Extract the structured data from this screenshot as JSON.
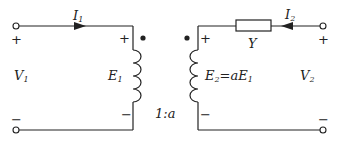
{
  "diagram": {
    "type": "ideal transformer equivalent circuit",
    "primary": {
      "current_label": "I",
      "current_sub": "1",
      "voltage_label": "V",
      "voltage_sub": "1",
      "emf_label": "E",
      "emf_sub": "1",
      "plus": "+",
      "minus": "−"
    },
    "secondary": {
      "current_label": "I",
      "current_sub": "2",
      "voltage_label": "V",
      "voltage_sub": "2",
      "emf_label": "E",
      "emf_sub": "2",
      "emf_eq": "=a",
      "emf_ref": "E",
      "emf_ref_sub": "1",
      "plus": "+",
      "minus": "−"
    },
    "admittance_label": "Y",
    "turns_ratio": "1:a",
    "colors": {
      "line": "#222222",
      "background": "#ffffff"
    }
  }
}
